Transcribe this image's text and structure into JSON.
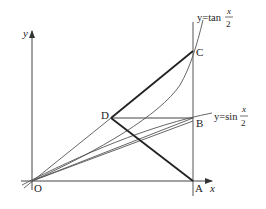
{
  "figure": {
    "axes": {
      "x_label": "x",
      "y_label": "y",
      "origin_label": "O"
    },
    "points": {
      "O": "O",
      "A": "A",
      "B": "B",
      "C": "C",
      "D": "D"
    },
    "curves": {
      "tan": {
        "prefix": "y=tan",
        "num": "x",
        "den": "2"
      },
      "sin": {
        "prefix": "y=sin",
        "num": "x",
        "den": "2"
      }
    },
    "colors": {
      "stroke": "#333333",
      "thin": "#555555",
      "background": "#ffffff"
    }
  }
}
